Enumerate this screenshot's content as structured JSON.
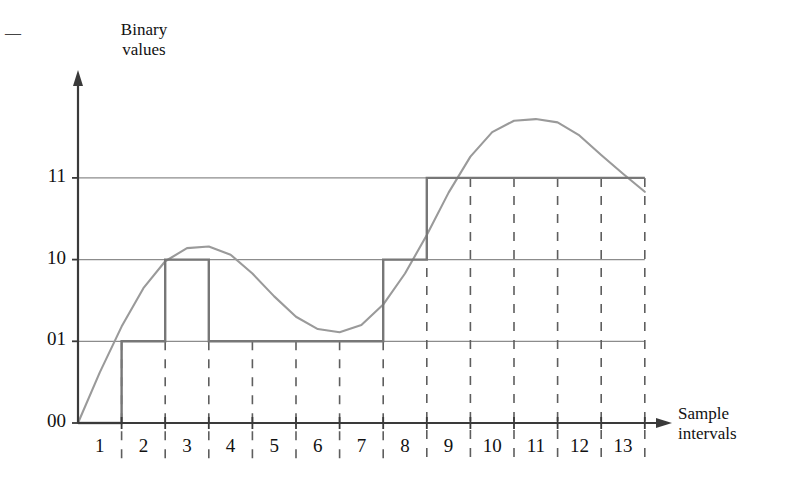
{
  "figure": {
    "y_axis_title": "Binary\nvalues",
    "x_axis_title": "Sample\nintervals",
    "left_margin_dash": "—"
  },
  "chart_data": {
    "type": "line",
    "title": "",
    "xlabel": "Sample intervals",
    "ylabel": "Binary values",
    "grid": true,
    "legend": "none",
    "x_tick_labels": [
      "1",
      "2",
      "3",
      "4",
      "5",
      "6",
      "7",
      "8",
      "9",
      "10",
      "11",
      "12",
      "13"
    ],
    "y_tick_labels": [
      "00",
      "01",
      "10",
      "11"
    ],
    "y_levels": [
      0,
      1,
      2,
      3
    ],
    "xlim": [
      0,
      13
    ],
    "ylim": [
      0,
      3
    ],
    "series": [
      {
        "name": "analog input signal",
        "type": "line",
        "style": "smooth-curve",
        "color": "#9a9a9a",
        "description": "Smooth analog waveform rising from 00 at interval 0, peaking just above 10 near interval 3, dipping to just above 01 near interval 6, rising to a maximum above 11 near interval 10-11, then falling to just below 11 at interval 13",
        "x": [
          0,
          0.5,
          1,
          1.5,
          2,
          2.5,
          3,
          3.5,
          4,
          4.5,
          5,
          5.5,
          6,
          6.5,
          7,
          7.5,
          8,
          8.5,
          9,
          9.5,
          10,
          10.5,
          11,
          11.5,
          12,
          12.5,
          13
        ],
        "y": [
          0.0,
          0.62,
          1.18,
          1.65,
          1.98,
          2.14,
          2.16,
          2.06,
          1.83,
          1.55,
          1.3,
          1.15,
          1.11,
          1.2,
          1.45,
          1.83,
          2.3,
          2.82,
          3.26,
          3.56,
          3.7,
          3.72,
          3.68,
          3.52,
          3.28,
          3.05,
          2.83
        ]
      },
      {
        "name": "quantized binary output",
        "type": "step",
        "style": "staircase",
        "color": "#777777",
        "description": "Staircase PCM quantization of the analog curve, one constant binary code per sample interval",
        "interval_codes": [
          {
            "interval": 1,
            "code": "00",
            "level": 0
          },
          {
            "interval": 2,
            "code": "01",
            "level": 1
          },
          {
            "interval": 3,
            "code": "10",
            "level": 2
          },
          {
            "interval": 4,
            "code": "01",
            "level": 1
          },
          {
            "interval": 5,
            "code": "01",
            "level": 1
          },
          {
            "interval": 6,
            "code": "01",
            "level": 1
          },
          {
            "interval": 7,
            "code": "01",
            "level": 1
          },
          {
            "interval": 8,
            "code": "10",
            "level": 2
          },
          {
            "interval": 9,
            "code": "11",
            "level": 3
          },
          {
            "interval": 10,
            "code": "11",
            "level": 3
          },
          {
            "interval": 11,
            "code": "11",
            "level": 3
          },
          {
            "interval": 12,
            "code": "11",
            "level": 3
          },
          {
            "interval": 13,
            "code": "11",
            "level": 3
          }
        ]
      }
    ],
    "colors": {
      "curve": "#9a9a9a",
      "staircase": "#777777",
      "gridline": "#8c8c8c",
      "axis": "#3a3a3a",
      "text": "#111111"
    }
  }
}
